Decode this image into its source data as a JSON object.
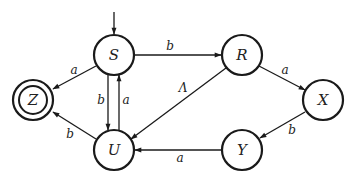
{
  "diagram": {
    "type": "finite-automaton",
    "start_state": "S",
    "accepting_states": [
      "Z"
    ],
    "states": [
      {
        "id": "S",
        "label": "S",
        "cx": 114,
        "cy": 55
      },
      {
        "id": "R",
        "label": "R",
        "cx": 242,
        "cy": 55
      },
      {
        "id": "X",
        "label": "X",
        "cx": 323,
        "cy": 100
      },
      {
        "id": "Y",
        "label": "Y",
        "cx": 242,
        "cy": 150
      },
      {
        "id": "U",
        "label": "U",
        "cx": 114,
        "cy": 150
      },
      {
        "id": "Z",
        "label": "Z",
        "cx": 33,
        "cy": 100
      }
    ],
    "transitions": [
      {
        "from": "S",
        "to": "R",
        "label": "b"
      },
      {
        "from": "S",
        "to": "Z",
        "label": "a"
      },
      {
        "from": "S",
        "to": "U",
        "label": "b"
      },
      {
        "from": "U",
        "to": "S",
        "label": "a"
      },
      {
        "from": "U",
        "to": "Z",
        "label": "b"
      },
      {
        "from": "R",
        "to": "U",
        "label": "Λ"
      },
      {
        "from": "R",
        "to": "X",
        "label": "a"
      },
      {
        "from": "X",
        "to": "Y",
        "label": "b"
      },
      {
        "from": "Y",
        "to": "U",
        "label": "a"
      }
    ]
  }
}
